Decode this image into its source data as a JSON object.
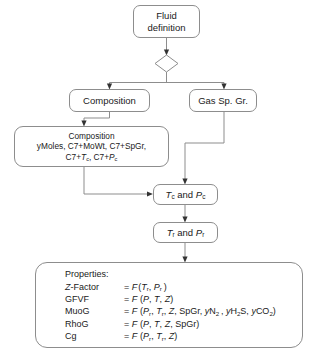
{
  "diagram": {
    "line_color": "#8d8d8d",
    "background": "#ffffff",
    "nodes": {
      "fluid_definition": {
        "label": "Fluid\ndefinition",
        "shape": "rounded-rect"
      },
      "decision": {
        "label": "",
        "shape": "diamond"
      },
      "composition": {
        "label": "Composition",
        "shape": "rounded-rect"
      },
      "gas_sp_gr": {
        "label": "Gas Sp. Gr.",
        "shape": "rounded-rect"
      },
      "composition_detail": {
        "line1": "Composition",
        "line2": "yMoles, C7+MoWt, C7+SpGr,",
        "line3_a": "C7+",
        "line3_b": "T",
        "line3_c": "c",
        "line3_d": ", C7+",
        "line3_e": "P",
        "line3_f": "c",
        "shape": "rounded-rect"
      },
      "tc_pc": {
        "var1": "T",
        "sub1": "c",
        "conj": " and ",
        "var2": "P",
        "sub2": "c",
        "shape": "rounded-rect"
      },
      "tr_pr": {
        "var1": "T",
        "sub1": "r",
        "conj": " and ",
        "var2": "P",
        "sub2": "r",
        "shape": "rounded-rect"
      },
      "properties": {
        "heading": "Properties:",
        "rows": [
          {
            "name_italic": "Z",
            "name_rest": "-Factor",
            "formula": "= F(Tr, Pr)"
          },
          {
            "name_italic": "",
            "name_rest": "GFVF",
            "formula": "= F(P, T, Z)"
          },
          {
            "name_italic": "",
            "name_rest": "MuoG",
            "formula": "= F(Pr, Tr, Z, SpGr, yN2, yH2S, yCO2)"
          },
          {
            "name_italic": "",
            "name_rest": "RhoG",
            "formula": "= F(P, T, Z, SpGr)"
          },
          {
            "name_italic": "",
            "name_rest": "Cg",
            "formula": "= F(Pr, Tr, Z)"
          }
        ]
      }
    },
    "edges": [
      {
        "from": "fluid_definition",
        "to": "decision",
        "arrow": true
      },
      {
        "from": "decision",
        "to": "composition",
        "arrow": true
      },
      {
        "from": "decision",
        "to": "gas_sp_gr",
        "arrow": true
      },
      {
        "from": "composition",
        "to": "composition_detail",
        "arrow": true
      },
      {
        "from": "gas_sp_gr",
        "to": "tc_pc",
        "arrow": true
      },
      {
        "from": "composition_detail",
        "to": "tc_pc",
        "arrow": true
      },
      {
        "from": "tc_pc",
        "to": "tr_pr",
        "arrow": true
      },
      {
        "from": "tr_pr",
        "to": "properties",
        "arrow": true
      }
    ]
  }
}
